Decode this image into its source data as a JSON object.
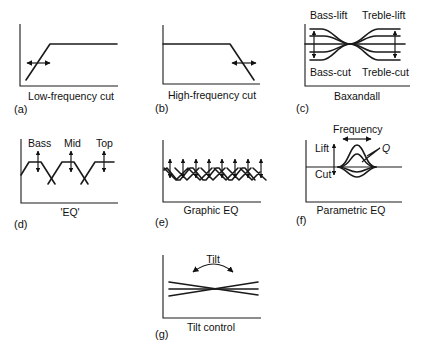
{
  "panels": [
    {
      "id": "a",
      "tag": "(a)",
      "caption": "Low-frequency cut"
    },
    {
      "id": "b",
      "tag": "(b)",
      "caption": "High-frequency cut"
    },
    {
      "id": "c",
      "tag": "(c)",
      "caption": "Baxandall",
      "labels": {
        "bass_lift": "Bass-lift",
        "treble_lift": "Treble-lift",
        "bass_cut": "Bass-cut",
        "treble_cut": "Treble-cut"
      }
    },
    {
      "id": "d",
      "tag": "(d)",
      "caption": "'EQ'",
      "labels": {
        "bass": "Bass",
        "mid": "Mid",
        "top": "Top"
      }
    },
    {
      "id": "e",
      "tag": "(e)",
      "caption": "Graphic EQ",
      "bands": 8
    },
    {
      "id": "f",
      "tag": "(f)",
      "caption": "Parametric EQ",
      "labels": {
        "frequency": "Frequency",
        "lift": "Lift",
        "cut": "Cut",
        "q": "Q"
      }
    },
    {
      "id": "g",
      "tag": "(g)",
      "caption": "Tilt control",
      "labels": {
        "tilt": "Tilt"
      }
    }
  ]
}
